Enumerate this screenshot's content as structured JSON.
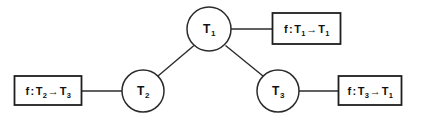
{
  "diagram": {
    "background_color": "#ffffff",
    "stroke_color": "#2b2b2b",
    "text_color": "#121212",
    "nodes": [
      {
        "id": "T1",
        "label": "T",
        "sub": "1",
        "cx": 209,
        "cy": 29,
        "r": 22
      },
      {
        "id": "T2",
        "label": "T",
        "sub": "2",
        "cx": 143,
        "cy": 91,
        "r": 21
      },
      {
        "id": "T3",
        "label": "T",
        "sub": "3",
        "cx": 278,
        "cy": 91,
        "r": 21
      }
    ],
    "edges": [
      {
        "from": "T1",
        "to": "T2",
        "x1": 194,
        "y1": 45,
        "x2": 158,
        "y2": 76
      },
      {
        "from": "T1",
        "to": "T3",
        "x1": 225,
        "y1": 45,
        "x2": 263,
        "y2": 76
      }
    ],
    "connectors": [
      {
        "node": "T1",
        "box": "box-t1",
        "x1": 231,
        "y1": 29,
        "x2": 272,
        "y2": 29
      },
      {
        "node": "T2",
        "box": "box-t2",
        "x1": 82,
        "y1": 91,
        "x2": 122,
        "y2": 91
      },
      {
        "node": "T3",
        "box": "box-t3",
        "x1": 299,
        "y1": 91,
        "x2": 338,
        "y2": 91
      }
    ],
    "label_boxes": [
      {
        "id": "box-t1",
        "attached_to": "T1",
        "x": 272,
        "y": 13,
        "w": 68,
        "h": 31,
        "text": "f : T1 → T1",
        "fn": "f",
        "domain": "T",
        "domain_sub": "1",
        "codomain": "T",
        "codomain_sub": "1",
        "arrow": "→"
      },
      {
        "id": "box-t2",
        "attached_to": "T2",
        "x": 14,
        "y": 76,
        "w": 68,
        "h": 30,
        "text": "f : T2 → T3",
        "fn": "f",
        "domain": "T",
        "domain_sub": "2",
        "codomain": "T",
        "codomain_sub": "3",
        "arrow": "→"
      },
      {
        "id": "box-t3",
        "attached_to": "T3",
        "x": 338,
        "y": 76,
        "w": 64,
        "h": 30,
        "text": "f : T3 → T1",
        "fn": "f",
        "domain": "T",
        "domain_sub": "3",
        "codomain": "T",
        "codomain_sub": "1",
        "arrow": "→"
      }
    ],
    "separator": ":"
  }
}
